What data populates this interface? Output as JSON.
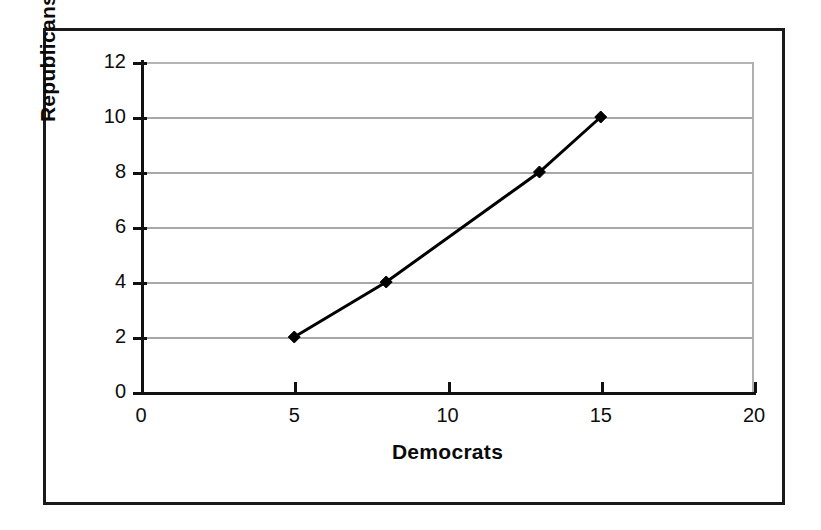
{
  "figure": {
    "background_color": "#ffffff",
    "frame_color": "#1a1a1a",
    "gridline_color": "#a8a8a8",
    "axis_color": "#111111",
    "series_color": "#000000"
  },
  "chart_data": {
    "type": "line",
    "title": "",
    "subtitle": "",
    "xlabel": "Democrats",
    "ylabel": "Republicans",
    "xlim": [
      0,
      20
    ],
    "ylim": [
      0,
      12
    ],
    "x_ticks": [
      0,
      5,
      10,
      15,
      20
    ],
    "x_tick_labels": [
      "0",
      "5",
      "10",
      "15",
      "20"
    ],
    "y_ticks": [
      0,
      2,
      4,
      6,
      8,
      10,
      12
    ],
    "y_tick_labels": [
      "0",
      "2",
      "4",
      "6",
      "8",
      "10",
      "12"
    ],
    "grid": {
      "horizontal": true,
      "vertical": false,
      "horizontal_at": [
        2,
        4,
        6,
        8,
        10,
        12
      ]
    },
    "legend": {
      "visible": false,
      "position": "none",
      "entries": []
    },
    "marker": "diamond",
    "marker_size": 9,
    "line_width": 3,
    "series": [
      {
        "name": "Republicans vs Democrats",
        "color": "#000000",
        "x": [
          5,
          8,
          13,
          15
        ],
        "y": [
          2,
          4,
          8,
          10
        ],
        "points": [
          {
            "x": 5,
            "y": 2
          },
          {
            "x": 8,
            "y": 4
          },
          {
            "x": 13,
            "y": 8
          },
          {
            "x": 15,
            "y": 10
          }
        ]
      }
    ],
    "annotations": []
  }
}
